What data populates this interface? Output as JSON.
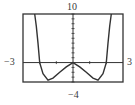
{
  "chart_data": {
    "type": "line",
    "title": "",
    "xlabel": "",
    "ylabel": "",
    "xlim": [
      -3,
      3
    ],
    "ylim": [
      -4,
      10
    ],
    "grid": false,
    "legend": null,
    "tick_labels": {
      "x_min": "−3",
      "x_max": "3",
      "y_min": "−4",
      "y_max": "10"
    },
    "x_ticks": [
      -2,
      -1,
      1,
      2
    ],
    "y_ticks": [
      -4,
      -3,
      -2,
      -1,
      1,
      2,
      3,
      4,
      5,
      6,
      7,
      8,
      9,
      10
    ],
    "series": [
      {
        "name": "f(x)",
        "x": [
          -2.3,
          -2.2,
          -2.1,
          -2.0,
          -1.8,
          -1.5,
          -1.2,
          -0.8,
          -0.4,
          0,
          0.4,
          0.8,
          1.2,
          1.5,
          1.8,
          2.0,
          2.1,
          2.2,
          2.3
        ],
        "y": [
          10,
          7.5,
          4,
          0,
          -2.3,
          -3.6,
          -3.2,
          -2.0,
          -0.9,
          0,
          -0.9,
          -2.0,
          -3.2,
          -3.6,
          -2.3,
          0,
          4,
          7.5,
          10
        ]
      }
    ],
    "annotations": []
  },
  "colors": {
    "frame": "#333333",
    "curve": "#333333",
    "axis": "#333333"
  }
}
